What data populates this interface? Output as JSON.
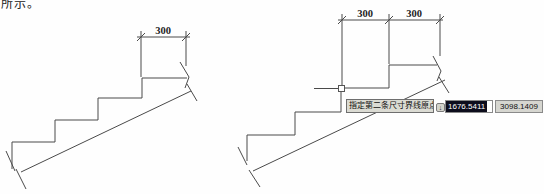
{
  "page": {
    "top_text": "所示。"
  },
  "drawings": {
    "left": {
      "dim_label": "300"
    },
    "right": {
      "dim_labels": [
        "300",
        "300"
      ]
    }
  },
  "tooltip": {
    "prompt": "指定第二条尺寸界线原点或",
    "down_key_glyph": "↓",
    "x_value": "1676.5411",
    "y_value": "3098.1409"
  },
  "colors": {
    "line": "#4a4a4a",
    "tooltip_bg": "#dbdbd3",
    "tooltip_border": "#6e6e6e",
    "field_bg": "#d6d6d0",
    "selected_field_bg": "#0d0d1c",
    "selected_field_text": "#ffffff"
  }
}
